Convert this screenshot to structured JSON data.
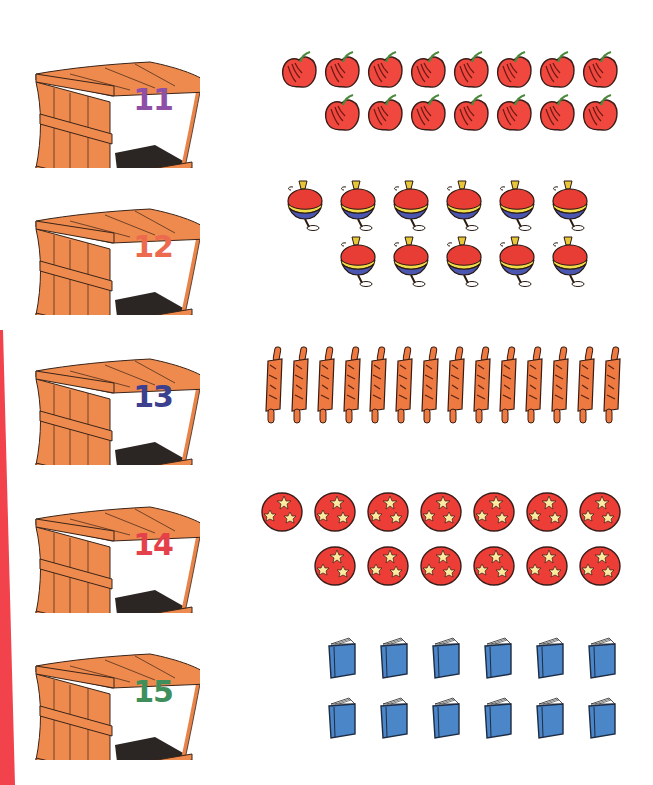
{
  "worksheet": {
    "edge_color": "#f2434d",
    "rows": [
      {
        "number": "11",
        "number_color": "#8e4fa6",
        "item": "apple",
        "item_icon": "apple-icon",
        "row1_count": 8,
        "row2_count": 7,
        "total": 15
      },
      {
        "number": "12",
        "number_color": "#ec6a4e",
        "item": "spinning-top",
        "item_icon": "spinning-top-icon",
        "row1_count": 6,
        "row2_count": 5,
        "total": 11
      },
      {
        "number": "13",
        "number_color": "#3d3f8f",
        "item": "rolling-pin",
        "item_icon": "rolling-pin-icon",
        "row1_count": 14,
        "row2_count": 0,
        "total": 14
      },
      {
        "number": "14",
        "number_color": "#e5414b",
        "item": "star-ball",
        "item_icon": "star-ball-icon",
        "row1_count": 7,
        "row2_count": 6,
        "total": 13
      },
      {
        "number": "15",
        "number_color": "#3f8f5c",
        "item": "book",
        "item_icon": "book-icon",
        "row1_count": 6,
        "row2_count": 6,
        "total": 12
      }
    ]
  }
}
